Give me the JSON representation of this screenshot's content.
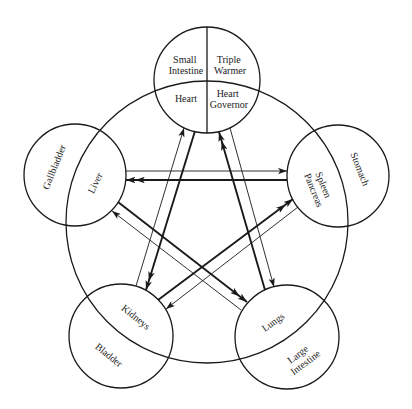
{
  "colors": {
    "stroke": "#1a1a1a",
    "background": "#ffffff",
    "text": "#222222"
  },
  "nodes": {
    "top_circle": {
      "upper_left": {
        "line1": "Small",
        "line2": "Intestine"
      },
      "upper_right": {
        "line1": "Triple",
        "line2": "Warmer"
      },
      "lower_left": "Heart",
      "lower_right": {
        "line1": "Heart",
        "line2": "Governor"
      }
    },
    "left_circle": {
      "outer": "Gallbladder",
      "inner": "Liver"
    },
    "right_circle": {
      "outer": "Stomach",
      "inner": {
        "line1": "Spleen",
        "line2": "Pancreas"
      }
    },
    "bottom_left_circle": {
      "outer": "Bladder",
      "inner": "Kidneys"
    },
    "bottom_right_circle": {
      "outer": {
        "line1": "Large",
        "line2": "Intestine"
      },
      "inner": "Lungs"
    }
  },
  "edges": [
    {
      "from": "Liver",
      "to": "Spleen/Pancreas",
      "weight": "thin",
      "arrowheads": 1
    },
    {
      "from": "Spleen/Pancreas",
      "to": "Liver",
      "weight": "thick",
      "arrowheads": 2
    },
    {
      "from": "Heart",
      "to": "Kidneys",
      "weight": "thick",
      "arrowheads": 2
    },
    {
      "from": "Kidneys",
      "to": "Heart",
      "weight": "thin",
      "arrowheads": 1
    },
    {
      "from": "Lungs",
      "to": "Heart Governor",
      "weight": "thick",
      "arrowheads": 2
    },
    {
      "from": "Heart Governor",
      "to": "Lungs",
      "weight": "thin",
      "arrowheads": 1
    },
    {
      "from": "Liver",
      "to": "Lungs",
      "weight": "thick",
      "arrowheads": 2
    },
    {
      "from": "Lungs",
      "to": "Liver",
      "weight": "thin",
      "arrowheads": 1
    },
    {
      "from": "Kidneys",
      "to": "Spleen/Pancreas",
      "weight": "thick",
      "arrowheads": 2
    },
    {
      "from": "Spleen/Pancreas",
      "to": "Kidneys",
      "weight": "thin",
      "arrowheads": 1
    }
  ]
}
